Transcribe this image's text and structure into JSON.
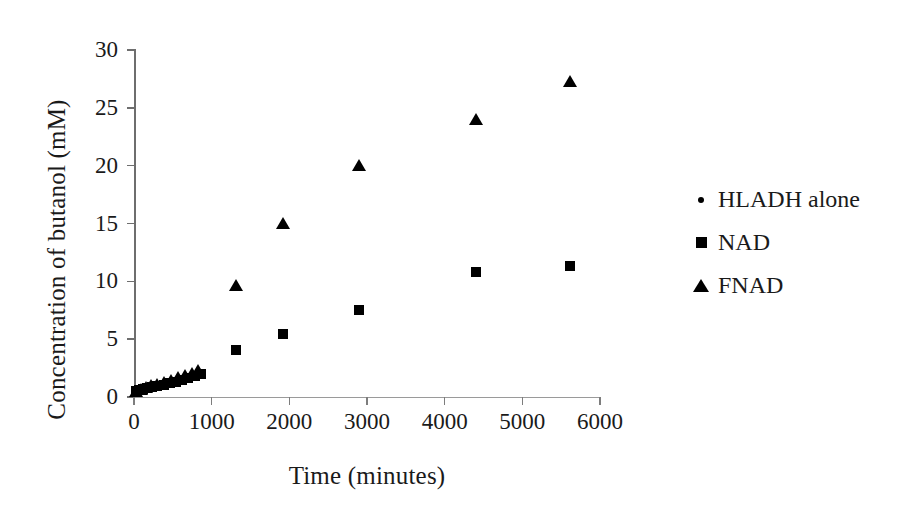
{
  "chart_data": {
    "type": "scatter",
    "title": "",
    "xlabel": "Time (minutes)",
    "ylabel": "Concentration of butanol (mM)",
    "xlim": [
      0,
      6000
    ],
    "ylim": [
      0,
      30
    ],
    "xticks": [
      0,
      1000,
      2000,
      3000,
      4000,
      5000,
      6000
    ],
    "yticks": [
      0,
      5,
      10,
      15,
      20,
      25,
      30
    ],
    "xtick_labels": [
      "0",
      "1000",
      "2000",
      "3000",
      "4000",
      "5000",
      "6000"
    ],
    "ytick_labels": [
      "0",
      "5",
      "10",
      "15",
      "20",
      "25",
      "30"
    ],
    "grid": false,
    "legend_position": "right",
    "marker_color": "#000000",
    "series": [
      {
        "name": "HLADH alone",
        "marker": "dot",
        "x": [
          10,
          40,
          70,
          100,
          130,
          160,
          200,
          240,
          280,
          320,
          360,
          400,
          440,
          480,
          520,
          560,
          600,
          640,
          680,
          720,
          760,
          800,
          840,
          870
        ],
        "y": [
          0.45,
          0.5,
          0.55,
          0.6,
          0.62,
          0.65,
          0.7,
          0.72,
          0.78,
          0.82,
          0.88,
          0.95,
          1.0,
          1.08,
          1.15,
          1.22,
          1.3,
          1.4,
          1.5,
          1.62,
          1.75,
          1.9,
          2.05,
          2.15
        ]
      },
      {
        "name": "NAD",
        "marker": "square",
        "x": [
          20,
          60,
          110,
          170,
          230,
          300,
          380,
          460,
          540,
          620,
          700,
          780,
          860,
          1310,
          1920,
          2900,
          4400,
          5620
        ],
        "y": [
          0.5,
          0.58,
          0.65,
          0.75,
          0.85,
          0.95,
          1.05,
          1.18,
          1.3,
          1.45,
          1.6,
          1.8,
          2.0,
          4.05,
          5.45,
          7.5,
          10.85,
          11.35
        ]
      },
      {
        "name": "FNAD",
        "marker": "triangle",
        "x": [
          30,
          90,
          150,
          220,
          300,
          390,
          480,
          570,
          660,
          750,
          830,
          1310,
          1920,
          2900,
          4400,
          5620
        ],
        "y": [
          0.55,
          0.7,
          0.85,
          1.0,
          1.15,
          1.3,
          1.5,
          1.7,
          1.9,
          2.1,
          2.3,
          9.7,
          15.05,
          20.1,
          24.0,
          27.3
        ]
      }
    ]
  },
  "legend": {
    "entries": [
      {
        "label": "HLADH alone",
        "marker": "dot-marker"
      },
      {
        "label": "NAD",
        "marker": "square-marker"
      },
      {
        "label": "FNAD",
        "marker": "triangle-marker"
      }
    ]
  }
}
